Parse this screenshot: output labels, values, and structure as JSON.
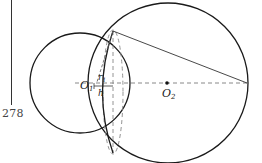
{
  "page": {
    "number": "278"
  },
  "diagram": {
    "labels": {
      "center_1": "O",
      "center_1_sub": "1",
      "center_2": "O",
      "center_2_sub": "2",
      "radius": "r",
      "radius_sub": "1",
      "height": "h"
    },
    "colors": {
      "stroke": "#1a1a1a",
      "dashed": "#888888",
      "text": "#222222"
    }
  }
}
